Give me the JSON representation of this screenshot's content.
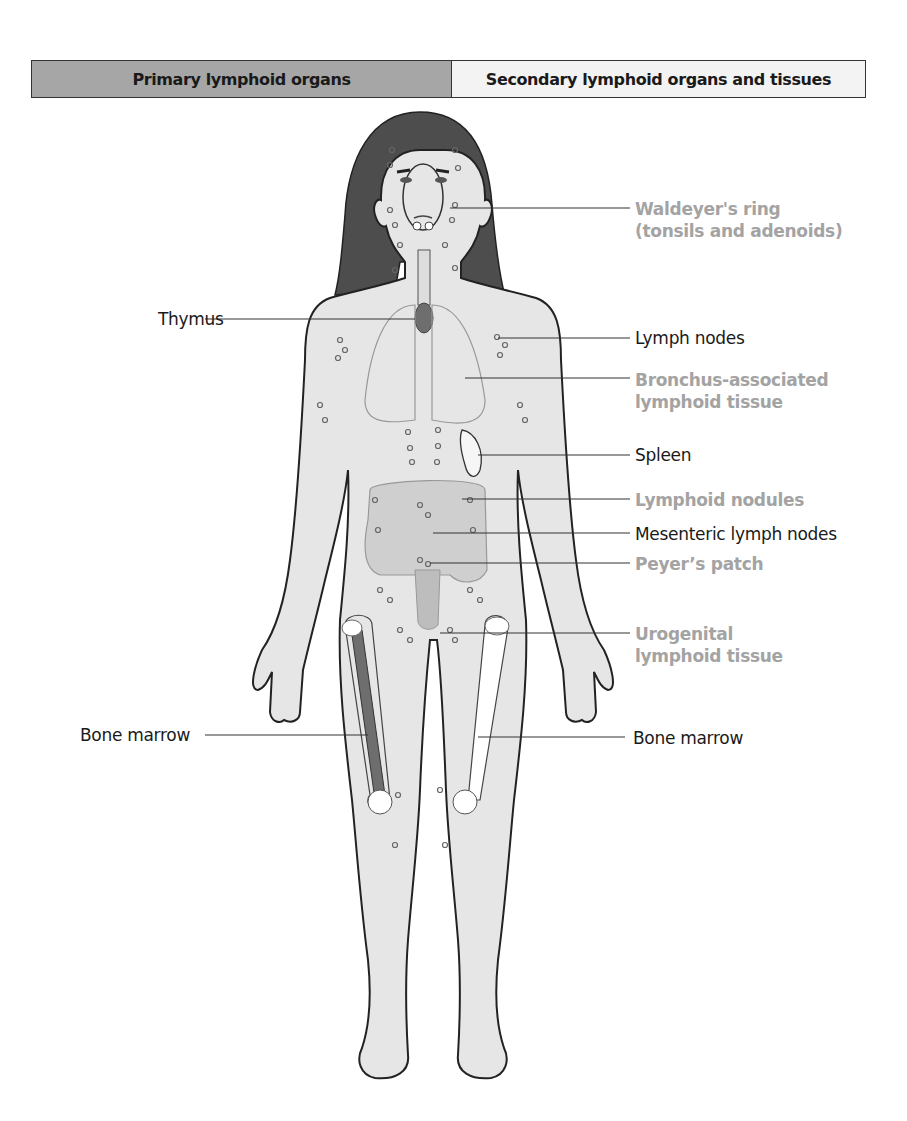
{
  "header": {
    "primary_label": "Primary lymphoid organs",
    "secondary_label": "Secondary lymphoid organs and tissues",
    "primary_color": "#a6a6a6",
    "secondary_color": "#f3f3f3"
  },
  "figure": {
    "skin_color": "#e6e6e6",
    "hair_color": "#4d4d4d",
    "primary_organ_color": "#6e6e6e",
    "lymph_node_marker": "small-circle-icon"
  },
  "labels": {
    "left": [
      {
        "text": "Thymus",
        "category": "primary"
      },
      {
        "text": "Bone marrow",
        "category": "primary"
      }
    ],
    "right": [
      {
        "text": "Waldeyer's ring",
        "text2": "(tonsils and adenoids)",
        "category": "secondary-light"
      },
      {
        "text": "Lymph nodes",
        "category": "secondary-dark"
      },
      {
        "text": "Bronchus-associated",
        "text2": "lymphoid tissue",
        "category": "secondary-light"
      },
      {
        "text": "Spleen",
        "category": "secondary-dark"
      },
      {
        "text": "Lymphoid nodules",
        "category": "secondary-light"
      },
      {
        "text": "Mesenteric lymph nodes",
        "category": "secondary-dark"
      },
      {
        "text": "Peyer’s patch",
        "category": "secondary-light"
      },
      {
        "text": "Urogenital",
        "text2": "lymphoid tissue",
        "category": "secondary-light"
      },
      {
        "text": "Bone marrow",
        "category": "secondary-dark"
      }
    ]
  }
}
